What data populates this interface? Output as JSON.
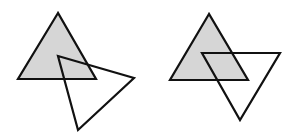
{
  "canvas": {
    "width": 296,
    "height": 139,
    "background": "#ffffff"
  },
  "style": {
    "stroke": "#111111",
    "stroke_width": 2.2,
    "fill_shaded": "#d6d6d6",
    "fill_none": "none"
  },
  "figures": [
    {
      "name": "left-figure",
      "shaded_triangle": {
        "points": "58,13 18,79 96,79"
      },
      "outline_triangle": {
        "points": "58,56 134,78 78,130"
      }
    },
    {
      "name": "right-figure",
      "shaded_triangle": {
        "points": "209,14 170,80 248,80"
      },
      "outline_triangle": {
        "points": "202,53 280,53 240,120"
      }
    }
  ]
}
